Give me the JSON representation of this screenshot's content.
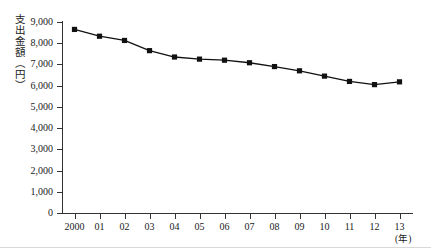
{
  "chart_data": {
    "type": "line",
    "title": "",
    "ylabel": "支出金額（円）",
    "xlabel": "(年)",
    "categories": [
      "2000",
      "01",
      "02",
      "03",
      "04",
      "05",
      "06",
      "07",
      "08",
      "09",
      "10",
      "11",
      "12",
      "13"
    ],
    "x": [
      2000,
      2001,
      2002,
      2003,
      2004,
      2005,
      2006,
      2007,
      2008,
      2009,
      2010,
      2011,
      2012,
      2013
    ],
    "values": [
      8650,
      8330,
      8130,
      7650,
      7350,
      7250,
      7200,
      7080,
      6900,
      6700,
      6450,
      6200,
      6050,
      6180
    ],
    "series": [
      {
        "name": "支出金額",
        "values": [
          8650,
          8330,
          8130,
          7650,
          7350,
          7250,
          7200,
          7080,
          6900,
          6700,
          6450,
          6200,
          6050,
          6180
        ]
      }
    ],
    "ylim": [
      0,
      9000
    ],
    "yticks": [
      0,
      1000,
      2000,
      3000,
      4000,
      5000,
      6000,
      7000,
      8000,
      9000
    ],
    "ytick_labels": [
      "0",
      "1,000",
      "2,000",
      "3,000",
      "4,000",
      "5,000",
      "6,000",
      "7,000",
      "8,000",
      "9,000"
    ],
    "grid": false,
    "legend": "none",
    "marker": "square",
    "line_color": "#111111",
    "marker_color": "#111111",
    "axis_color": "#333333",
    "background": "#ffffff"
  }
}
